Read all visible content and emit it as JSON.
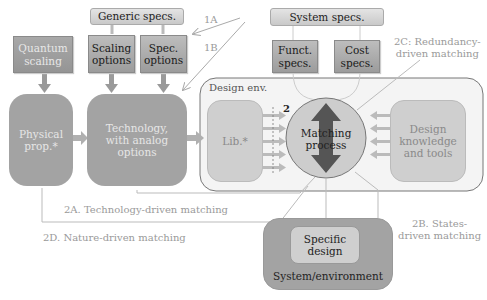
{
  "diagram": {
    "boxes": {
      "generic_specs": "Generic specs.",
      "system_specs": "System specs.",
      "quantum_scaling": [
        "Quantum",
        "scaling"
      ],
      "scaling_options": [
        "Scaling",
        "options"
      ],
      "spec_options": [
        "Spec.",
        "options"
      ],
      "funct_specs": [
        "Funct.",
        "specs."
      ],
      "cost_specs": [
        "Cost",
        "specs."
      ],
      "physical_prop": [
        "Physical",
        "prop.*"
      ],
      "technology": [
        "Technology,",
        "with analog",
        "options"
      ],
      "design_env": "Design env.",
      "lib": "Lib.*",
      "matching_process": [
        "Matching",
        "process"
      ],
      "design_knowledge": [
        "Design",
        "knowledge",
        "and tools"
      ],
      "specific_design": [
        "Specific",
        "design"
      ],
      "system_environment": "System/environment"
    },
    "labels": {
      "1A": "1A",
      "1B": "1B",
      "two": "2",
      "2A": "2A. Technology-driven matching",
      "2B": [
        "2B. States-",
        "driven matching"
      ],
      "2C": [
        "2C: Redundancy-",
        "driven matching"
      ],
      "2D": "2D. Nature-driven matching"
    },
    "colors": {
      "dark_box": "#a3a3a3",
      "spec_box": "#b0b0b0",
      "env_border": "#777777",
      "arrow_dark": "#555555",
      "label_text": "#9a9a9a"
    }
  }
}
